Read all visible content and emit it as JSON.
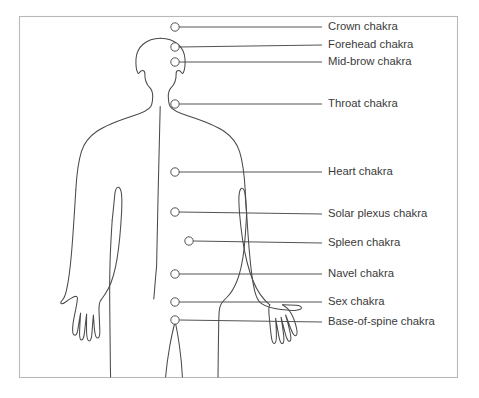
{
  "diagram": {
    "title": "Chakra locations on the human body",
    "frame": {
      "x": 19,
      "y": 16,
      "width": 439,
      "height": 362,
      "stroke": "#b9b9b9"
    },
    "colors": {
      "outline": "#4a4a4a",
      "leader": "#4a4a4a",
      "text": "#3a3a3a",
      "background": "#ffffff",
      "frame": "#b9b9b9"
    },
    "label_x": 328,
    "leader_end_x": 322,
    "marker_radius": 4.2,
    "chakras": [
      {
        "label": "Crown chakra",
        "marker_x": 175,
        "marker_y": 27,
        "label_y": 27
      },
      {
        "label": "Forehead chakra",
        "marker_x": 175,
        "marker_y": 47,
        "label_y": 45
      },
      {
        "label": "Mid-brow chakra",
        "marker_x": 175,
        "marker_y": 62,
        "label_y": 62
      },
      {
        "label": "Throat chakra",
        "marker_x": 175,
        "marker_y": 104,
        "label_y": 104
      },
      {
        "label": "Heart chakra",
        "marker_x": 175,
        "marker_y": 172,
        "label_y": 172
      },
      {
        "label": "Solar plexus chakra",
        "marker_x": 175,
        "marker_y": 212,
        "label_y": 214
      },
      {
        "label": "Spleen chakra",
        "marker_x": 189,
        "marker_y": 241,
        "label_y": 243
      },
      {
        "label": "Navel chakra",
        "marker_x": 175,
        "marker_y": 274,
        "label_y": 274
      },
      {
        "label": "Sex chakra",
        "marker_x": 175,
        "marker_y": 302,
        "label_y": 302
      },
      {
        "label": "Base-of-spine chakra",
        "marker_x": 175,
        "marker_y": 320,
        "label_y": 322
      }
    ]
  }
}
